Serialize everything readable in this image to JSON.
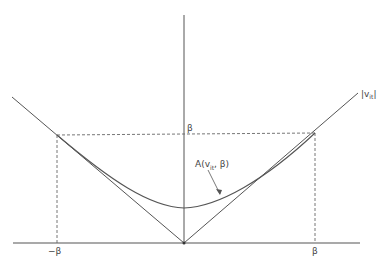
{
  "diagram": {
    "type": "function-plot",
    "colors": {
      "line": "#555555",
      "background": "#ffffff"
    },
    "labels": {
      "abs_main": "|v",
      "abs_sub": "it",
      "abs_close": "|",
      "approx_main": "A(v",
      "approx_sub": "it",
      "approx_tail": ", β)",
      "beta_y": "β",
      "neg_beta_x": "−β",
      "beta_x": "β"
    }
  }
}
